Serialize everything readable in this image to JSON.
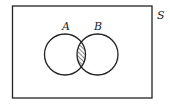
{
  "diagram": {
    "type": "venn",
    "title": "",
    "universe": {
      "label": "S",
      "rect": {
        "x": 12.5,
        "y": 6,
        "width": 139.5,
        "height": 92
      }
    },
    "sets": [
      {
        "label": "A",
        "cx": 65,
        "cy": 54.5,
        "r": 20.5
      },
      {
        "label": "B",
        "cx": 97.5,
        "cy": 54.5,
        "r": 20.5
      }
    ],
    "shaded_region": "A ∩ B",
    "shading": "hatched",
    "colors": {
      "stroke": "#222222",
      "background": "#ffffff"
    }
  }
}
